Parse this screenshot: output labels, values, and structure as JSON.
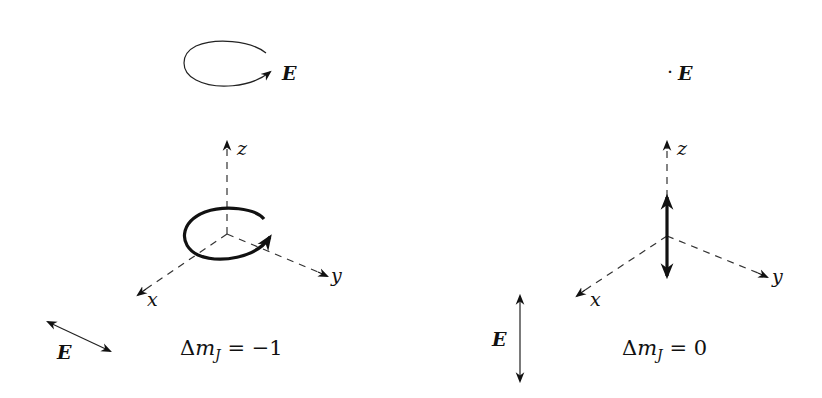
{
  "figure": {
    "left_panel": {
      "field_label_top": "E",
      "axes": {
        "x": "x",
        "y": "y",
        "z": "z"
      },
      "field_label_bottom": "E",
      "transition": {
        "delta": "Δ",
        "m": "m",
        "sub": "J",
        "eq": " = −1"
      }
    },
    "right_panel": {
      "field_label_top": "E",
      "dot": "·",
      "axes": {
        "x": "x",
        "y": "y",
        "z": "z"
      },
      "field_label_bottom": "E",
      "transition": {
        "delta": "Δ",
        "m": "m",
        "sub": "J",
        "eq": " = 0"
      }
    }
  }
}
